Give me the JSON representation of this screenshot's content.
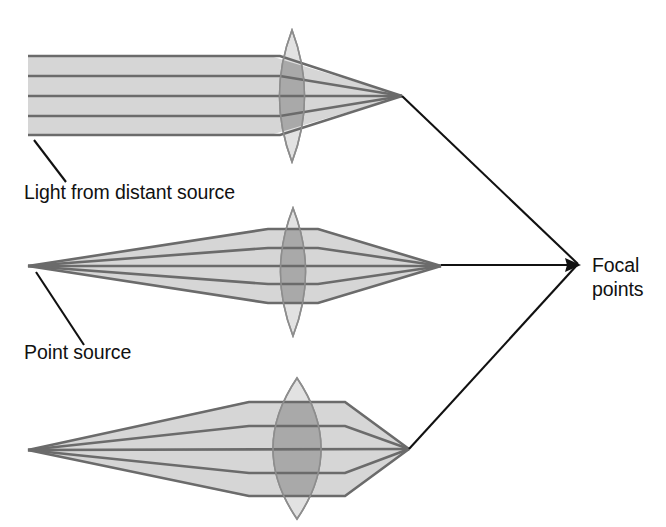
{
  "figure": {
    "width": 666,
    "height": 527,
    "background": "#ffffff"
  },
  "colors": {
    "beam_fill": "#d6d6d6",
    "lens_fill": "#e2e2e2",
    "lens_beam_overlap": "#a9a9a9",
    "ray_line": "#6b6b6b",
    "leader_line": "#111111",
    "text": "#111111"
  },
  "labels": {
    "distant_source": "Light from distant source",
    "point_source": "Point source",
    "focal_points_line1": "Focal",
    "focal_points_line2": "points"
  },
  "panels": [
    {
      "id": "panel-parallel",
      "name": "parallel-rays-panel",
      "source_type": "distant",
      "label": "Light from distant source",
      "beam_left_x": 28,
      "beam_top_y": 55,
      "beam_bottom_y": 136,
      "lens_center_x": 292,
      "lens_half_width": 25,
      "lens_top_y": 30,
      "lens_bottom_y": 162,
      "focal_x": 402,
      "focal_y": 96,
      "ray_offsets": [
        -40,
        -20,
        0,
        20,
        40
      ],
      "leader": {
        "x1": 34,
        "y1": 140,
        "x2": 66,
        "y2": 182
      },
      "label_x": 24,
      "label_y": 199
    },
    {
      "id": "panel-point-thin",
      "name": "point-source-thin-lens-panel",
      "source_type": "point",
      "label": "Point source",
      "source_x": 28,
      "source_y": 266,
      "lens_center_x": 293,
      "lens_half_width": 25,
      "lens_top_y": 208,
      "lens_bottom_y": 336,
      "lens_entry_half_height": 38,
      "focal_x": 441,
      "focal_y": 266,
      "ray_offsets": [
        -38,
        -19,
        0,
        19,
        38
      ],
      "leader": {
        "x1": 36,
        "y1": 272,
        "x2": 84,
        "y2": 345
      },
      "label_x": 24,
      "label_y": 359
    },
    {
      "id": "panel-point-thick",
      "name": "point-source-thick-lens-panel",
      "source_type": "point",
      "label": "",
      "source_x": 28,
      "source_y": 450,
      "lens_center_x": 297,
      "lens_half_width": 48,
      "lens_top_y": 378,
      "lens_bottom_y": 519,
      "lens_entry_half_height": 48,
      "focal_x": 409,
      "focal_y": 449,
      "ray_offsets": [
        -48,
        -24,
        0,
        24,
        48
      ],
      "leader": null,
      "label_x": 0,
      "label_y": 0
    }
  ],
  "focal_callout": {
    "name": "focal-points-callout",
    "vertex_x": 578,
    "vertex_y": 264,
    "arrow_from_x": 478,
    "arrow_to_x": 576,
    "text_x": 592,
    "text_line1_y": 258,
    "text_line2_y": 281,
    "leader_top": {
      "x1": 402,
      "y1": 96,
      "x2": 578,
      "y2": 264
    },
    "leader_bottom": {
      "x1": 409,
      "y1": 449,
      "x2": 578,
      "y2": 264
    }
  }
}
